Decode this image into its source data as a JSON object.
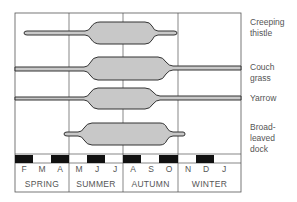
{
  "diagram": {
    "type": "seasonal-growth-kite-diagram",
    "colors": {
      "fill": "#c8c8c8",
      "outline": "#333333",
      "grid": "#555555",
      "month_dark": "#111111",
      "text": "#555555"
    },
    "species": [
      {
        "name": "Creeping thistle",
        "label_lines": [
          "Creeping",
          "thistle"
        ]
      },
      {
        "name": "Couch grass",
        "label_lines": [
          "Couch grass"
        ]
      },
      {
        "name": "Yarrow",
        "label_lines": [
          "Yarrow"
        ]
      },
      {
        "name": "Broad-leaved dock",
        "label_lines": [
          "Broad-leaved",
          "dock"
        ]
      }
    ],
    "months": [
      "F",
      "M",
      "A",
      "M",
      "J",
      "J",
      "A",
      "S",
      "O",
      "N",
      "D",
      "J"
    ],
    "seasons": [
      "SPRING",
      "SUMMER",
      "AUTUMN",
      "WINTER"
    ]
  }
}
